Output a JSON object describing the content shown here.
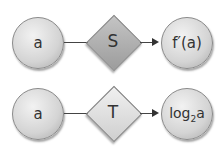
{
  "rows": [
    {
      "input": "a",
      "operator": "S",
      "operator_fill": "#a8a8a8",
      "output": "f′(a)"
    },
    {
      "input": "a",
      "operator": "T",
      "operator_fill": "#e0e0e0",
      "output_base": "log",
      "output_sub": "2",
      "output_arg": "a"
    }
  ]
}
